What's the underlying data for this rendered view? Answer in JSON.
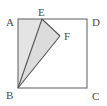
{
  "figure": {
    "kind": "geometry-diagram",
    "background_color": "#ffffff",
    "stroke_color": "#6b6b6b",
    "label_color": "#4a4a4a",
    "shade_color_quad": "#e0e0e0",
    "shade_color_triangle": "#d8d8d8",
    "square": {
      "name": "ABCD",
      "corners": [
        {
          "id": "A",
          "label": "A",
          "x": 18,
          "y": 19
        },
        {
          "id": "D",
          "label": "D",
          "x": 87,
          "y": 19
        },
        {
          "id": "C",
          "label": "C",
          "x": 87,
          "y": 88
        },
        {
          "id": "B",
          "label": "B",
          "x": 18,
          "y": 88
        }
      ]
    },
    "points": [
      {
        "id": "E",
        "label": "E",
        "x": 42,
        "y": 19,
        "on": "AD"
      },
      {
        "id": "F",
        "label": "F",
        "x": 60,
        "y": 36,
        "on": "interior"
      }
    ],
    "segments": [
      {
        "id": "AB",
        "from": "A",
        "to": "B"
      },
      {
        "id": "AD",
        "from": "A",
        "to": "D"
      },
      {
        "id": "DC",
        "from": "D",
        "to": "C"
      },
      {
        "id": "BC",
        "from": "B",
        "to": "C"
      },
      {
        "id": "BE",
        "from": "B",
        "to": "E"
      },
      {
        "id": "EF",
        "from": "E",
        "to": "F"
      },
      {
        "id": "FB",
        "from": "F",
        "to": "B"
      }
    ],
    "shaded_regions": [
      {
        "id": "AEB",
        "polygon": "A,E,B",
        "fill": "#e4e4e4"
      },
      {
        "id": "BEF",
        "polygon": "B,E,F",
        "fill": "#dcdcdc"
      }
    ],
    "labels": {
      "A": {
        "text": "A",
        "x": 6,
        "y": 20
      },
      "D": {
        "text": "D",
        "x": 92,
        "y": 20
      },
      "B": {
        "text": "B",
        "x": 6,
        "y": 97
      },
      "C": {
        "text": "C",
        "x": 92,
        "y": 98
      },
      "E": {
        "text": "E",
        "x": 39,
        "y": 16
      },
      "F": {
        "text": "F",
        "x": 64,
        "y": 39
      }
    }
  }
}
